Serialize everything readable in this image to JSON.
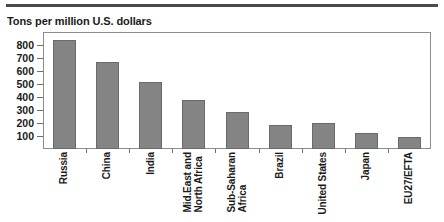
{
  "chart_data": {
    "type": "bar",
    "title": "Tons per million U.S. dollars",
    "xlabel": "",
    "ylabel": "",
    "ylim": [
      0,
      900
    ],
    "grid": false,
    "legend": false,
    "orientation": "vertical",
    "bar_color": "#848484",
    "categories": [
      "Russia",
      "China",
      "India",
      "Mid.East and North Africa",
      "Sub-Saharan Africa",
      "Brazil",
      "United States",
      "Japan",
      "EU27/EFTA"
    ],
    "category_lines": [
      [
        "Russia"
      ],
      [
        "China"
      ],
      [
        "India"
      ],
      [
        "Mid.East and",
        "North Africa"
      ],
      [
        "Sub-Saharan",
        "Africa"
      ],
      [
        "Brazil"
      ],
      [
        "United States"
      ],
      [
        "Japan"
      ],
      [
        "EU27/EFTA"
      ]
    ],
    "values": [
      840,
      670,
      515,
      375,
      285,
      185,
      200,
      120,
      95
    ],
    "yticks": [
      800,
      700,
      600,
      500,
      400,
      300,
      200,
      100
    ],
    "ytick_labels": [
      "800",
      "700",
      "600",
      "500",
      "400",
      "300",
      "200",
      "100"
    ]
  },
  "style": {
    "rule_color": "#4a4a52",
    "frame_color": "#8d8d8d",
    "text_color": "#1a1a1a",
    "background": "#ffffff"
  }
}
